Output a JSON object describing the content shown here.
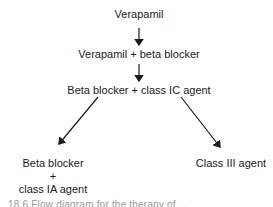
{
  "diagram": {
    "nodes": [
      {
        "id": "verapamil",
        "label": "Verapamil"
      },
      {
        "id": "verapamil-beta",
        "label": "Verapamil + beta blocker"
      },
      {
        "id": "beta-ic",
        "label": "Beta blocker + class IC agent"
      },
      {
        "id": "beta-ia",
        "lines": [
          "Beta blocker",
          "+",
          "class IA agent"
        ]
      },
      {
        "id": "class-iii",
        "label": "Class III agent"
      }
    ],
    "edges": [
      {
        "from": "verapamil",
        "to": "verapamil-beta"
      },
      {
        "from": "verapamil-beta",
        "to": "beta-ic"
      },
      {
        "from": "beta-ic",
        "to": "beta-ia"
      },
      {
        "from": "beta-ic",
        "to": "class-iii"
      }
    ],
    "caption": "18.6  Flow diagram for the therapy of ..."
  }
}
